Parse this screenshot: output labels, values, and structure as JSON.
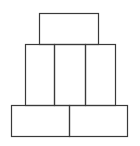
{
  "diagram": {
    "stroke_color": "#3a3a3a",
    "background": "#ffffff",
    "tiers": [
      {
        "name": "top",
        "blocks": [
          {
            "x": 39,
            "y": 13,
            "w": 59,
            "h": 31
          }
        ]
      },
      {
        "name": "middle",
        "blocks": [
          {
            "x": 25,
            "y": 44,
            "w": 29,
            "h": 61
          },
          {
            "x": 54,
            "y": 44,
            "w": 31,
            "h": 61
          },
          {
            "x": 85,
            "y": 44,
            "w": 30,
            "h": 61
          }
        ]
      },
      {
        "name": "bottom",
        "blocks": [
          {
            "x": 11,
            "y": 105,
            "w": 58,
            "h": 31
          },
          {
            "x": 69,
            "y": 105,
            "w": 58,
            "h": 31
          }
        ]
      }
    ]
  }
}
